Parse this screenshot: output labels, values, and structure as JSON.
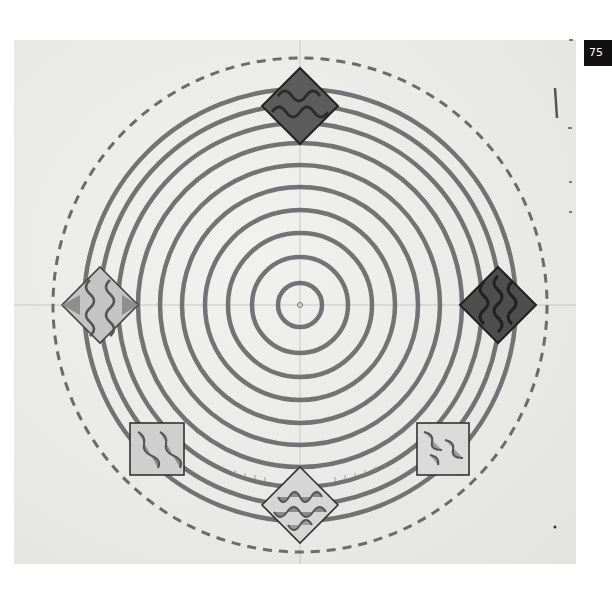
{
  "page": {
    "number": "75"
  },
  "drawing": {
    "subject": "Pencil and watercolor design sketch: concentric circles with diamond motifs",
    "center": [
      300,
      305
    ],
    "rings": [
      22,
      48,
      72,
      95,
      118,
      140,
      162,
      182,
      200,
      216
    ],
    "dashed_outer_radius": 247,
    "diamonds": [
      {
        "name": "top",
        "cx": 300,
        "cy": 106,
        "half": 38,
        "fill": "#5c5c5c"
      },
      {
        "name": "right",
        "cx": 498,
        "cy": 305,
        "half": 38,
        "fill": "#4e4e4e"
      },
      {
        "name": "left",
        "cx": 100,
        "cy": 305,
        "half": 38,
        "fill": "#9a9a9a"
      },
      {
        "name": "bottom",
        "cx": 300,
        "cy": 505,
        "half": 38,
        "fill": "#8a8a8a"
      }
    ],
    "squares": [
      {
        "name": "lower-left",
        "x": 130,
        "y": 423,
        "w": 54,
        "h": 52
      },
      {
        "name": "lower-right",
        "x": 417,
        "y": 423,
        "w": 52,
        "h": 52
      }
    ],
    "colors": {
      "pencil": "#5a5a5a",
      "paper": "#ebebe9",
      "badge": "#111111"
    }
  }
}
